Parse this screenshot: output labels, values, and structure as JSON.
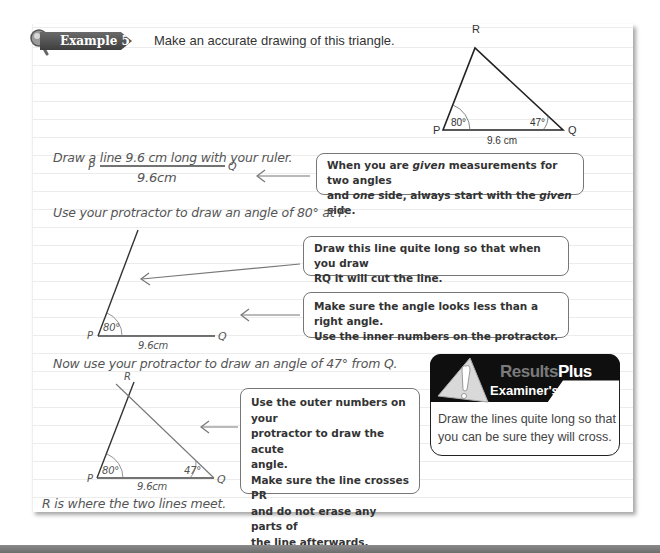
{
  "example": {
    "badge_label": "Example 5",
    "instruction": "Make an accurate drawing of this triangle."
  },
  "reference_triangle": {
    "vertex_labels": {
      "P": "P",
      "Q": "Q",
      "R": "R"
    },
    "angle_P": "80°",
    "angle_Q": "47°",
    "side_PQ": "9.6 cm"
  },
  "steps": [
    {
      "text": "Draw a line 9.6 cm long with your ruler.",
      "diagram": {
        "P": "P",
        "Q": "Q",
        "length": "9.6cm"
      },
      "callouts": [
        {
          "text": "When you are given measurements for two angles and one side, always start with the given side."
        }
      ]
    },
    {
      "text": "Use your protractor to draw an angle of 80° at P.",
      "diagram": {
        "P": "P",
        "Q": "Q",
        "angle": "80°",
        "length": "9.6cm"
      },
      "callouts": [
        {
          "text": "Draw this line quite long so that when you draw RQ it will cut the line."
        },
        {
          "text": "Make sure the angle looks less than a right angle. Use the inner numbers on the protractor."
        }
      ]
    },
    {
      "text": "Now use your protractor to draw an angle of 47° from Q.",
      "diagram": {
        "P": "P",
        "Q": "Q",
        "R": "R",
        "angle_P": "80°",
        "angle_Q": "47°",
        "length": "9.6cm"
      },
      "callouts": [
        {
          "text": "Use the outer numbers on your protractor to draw the acute angle. Make sure the line crosses PR and do not erase any parts of the line afterwards."
        }
      ]
    }
  ],
  "conclusion": "R is where the two lines meet.",
  "examiner_tip": {
    "brand_results": "Results",
    "brand_plus": "Plus",
    "title": "Examiner's Tip",
    "text": "Draw the lines quite long so that you can be sure they will cross."
  },
  "callout_lines": {
    "c1_line1": "When you are ",
    "c1_given": "given",
    "c1_line1b": " measurements for two angles",
    "c1_line2a": "and ",
    "c1_one": "one",
    "c1_line2b": " side, always start with the ",
    "c1_given2": "given",
    "c1_line2c": " side.",
    "c2_line1": "Draw this line quite long so that when you draw",
    "c2_line2": "RQ it will cut the line.",
    "c3_line1": "Make sure the angle looks less than a right angle.",
    "c3_line2": "Use the inner numbers on the protractor.",
    "c4_line1": "Use the outer numbers on your",
    "c4_line2": "protractor to draw the acute",
    "c4_line3": "angle.",
    "c4_line4": "Make sure the line crosses PR",
    "c4_line5": "and do not erase any parts of",
    "c4_line6": "the line afterwards."
  },
  "colors": {
    "badge": "#4a4a4a",
    "tip_header": "#0f0f0f",
    "line": "#333333",
    "arrow": "#777777"
  }
}
